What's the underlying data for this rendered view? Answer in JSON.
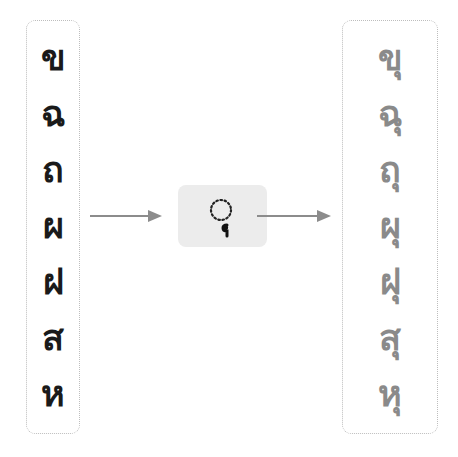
{
  "diagram": {
    "input_column": {
      "characters": [
        "ข",
        "ฉ",
        "ถ",
        "ผ",
        "ฝ",
        "ส",
        "ห"
      ]
    },
    "operator": {
      "mark_display": "◌ุ",
      "description": "combining vowel sara u"
    },
    "output_column": {
      "characters": [
        "ขุ",
        "ฉุ",
        "ถุ",
        "ผุ",
        "ฝุ",
        "สุ",
        "หุ"
      ],
      "base_characters": [
        "ข",
        "ฉ",
        "ถ",
        "ผ",
        "ฝ",
        "ส",
        "ห"
      ],
      "mark": "ุ"
    },
    "colors": {
      "input_text": "#1a1a1a",
      "output_base_text": "#8a8a8a",
      "mark_text": "#111111",
      "arrow": "#8c8c8c",
      "border": "#bdbdbd",
      "operator_bg": "#ececec"
    }
  }
}
